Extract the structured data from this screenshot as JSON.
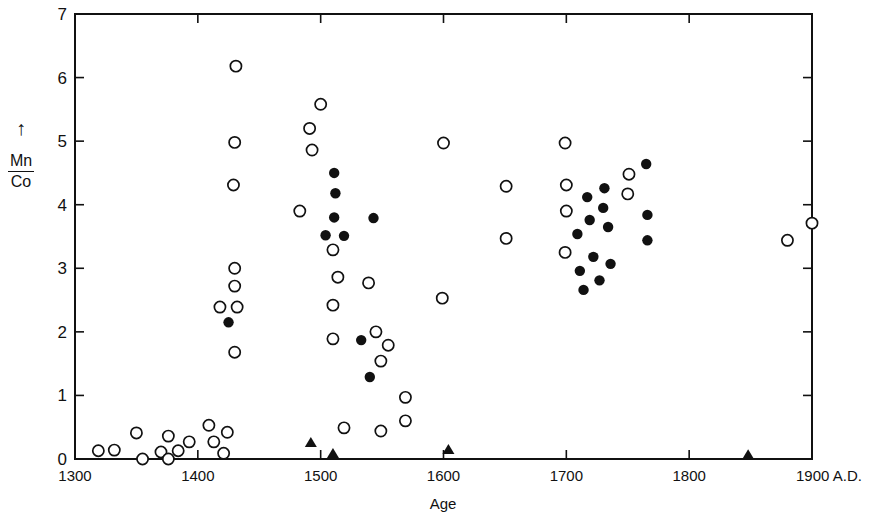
{
  "chart_data": {
    "type": "scatter",
    "title": "",
    "xlabel": "Age",
    "ylabel_numerator": "Mn",
    "ylabel_denominator": "Co",
    "ylabel_arrow": "↑",
    "x_unit_suffix": "A.D.",
    "xlim": [
      1300,
      1900
    ],
    "ylim": [
      0,
      7
    ],
    "x_ticks": [
      1300,
      1400,
      1500,
      1600,
      1700,
      1800,
      1900
    ],
    "x_tick_labels": [
      "1300",
      "1400",
      "1500",
      "1600",
      "1700",
      "1800",
      "1900 A.D."
    ],
    "y_ticks": [
      0,
      1,
      2,
      3,
      4,
      5,
      6,
      7
    ],
    "y_tick_labels": [
      "0",
      "1",
      "2",
      "3",
      "4",
      "5",
      "6",
      "7"
    ],
    "grid": false,
    "legend": null,
    "series": [
      {
        "name": "open circles",
        "marker": "open-circle",
        "points": [
          [
            1319,
            0.13
          ],
          [
            1332,
            0.14
          ],
          [
            1350,
            0.41
          ],
          [
            1355,
            0.0
          ],
          [
            1370,
            0.11
          ],
          [
            1376,
            0.36
          ],
          [
            1384,
            0.13
          ],
          [
            1376,
            0.0
          ],
          [
            1393,
            0.27
          ],
          [
            1409,
            0.53
          ],
          [
            1424,
            0.42
          ],
          [
            1413,
            0.27
          ],
          [
            1421,
            0.09
          ],
          [
            1431,
            6.18
          ],
          [
            1430,
            4.98
          ],
          [
            1429,
            4.31
          ],
          [
            1430,
            3.0
          ],
          [
            1430,
            2.72
          ],
          [
            1418,
            2.39
          ],
          [
            1432,
            2.39
          ],
          [
            1430,
            1.68
          ],
          [
            1500,
            5.58
          ],
          [
            1491,
            5.2
          ],
          [
            1493,
            4.86
          ],
          [
            1483,
            3.9
          ],
          [
            1510,
            3.29
          ],
          [
            1514,
            2.86
          ],
          [
            1539,
            2.77
          ],
          [
            1510,
            2.42
          ],
          [
            1510,
            1.89
          ],
          [
            1545,
            2.0
          ],
          [
            1555,
            1.79
          ],
          [
            1549,
            1.54
          ],
          [
            1569,
            0.97
          ],
          [
            1569,
            0.6
          ],
          [
            1519,
            0.49
          ],
          [
            1549,
            0.44
          ],
          [
            1600,
            4.97
          ],
          [
            1651,
            4.29
          ],
          [
            1651,
            3.47
          ],
          [
            1599,
            2.53
          ],
          [
            1699,
            4.97
          ],
          [
            1700,
            4.31
          ],
          [
            1700,
            3.9
          ],
          [
            1699,
            3.25
          ],
          [
            1751,
            4.48
          ],
          [
            1750,
            4.17
          ],
          [
            1880,
            3.44
          ],
          [
            1900,
            3.71
          ]
        ]
      },
      {
        "name": "filled circles",
        "marker": "filled-circle",
        "points": [
          [
            1425,
            2.15
          ],
          [
            1511,
            4.5
          ],
          [
            1512,
            4.18
          ],
          [
            1511,
            3.8
          ],
          [
            1504,
            3.52
          ],
          [
            1519,
            3.51
          ],
          [
            1543,
            3.79
          ],
          [
            1533,
            1.87
          ],
          [
            1540,
            1.29
          ],
          [
            1765,
            4.64
          ],
          [
            1731,
            4.26
          ],
          [
            1717,
            4.12
          ],
          [
            1730,
            3.95
          ],
          [
            1766,
            3.84
          ],
          [
            1719,
            3.76
          ],
          [
            1734,
            3.65
          ],
          [
            1709,
            3.54
          ],
          [
            1766,
            3.44
          ],
          [
            1722,
            3.18
          ],
          [
            1736,
            3.07
          ],
          [
            1711,
            2.96
          ],
          [
            1727,
            2.81
          ],
          [
            1714,
            2.66
          ]
        ]
      },
      {
        "name": "triangles",
        "marker": "filled-triangle",
        "points": [
          [
            1492,
            0.25
          ],
          [
            1510,
            0.08
          ],
          [
            1604,
            0.14
          ],
          [
            1848,
            0.06
          ]
        ]
      }
    ]
  },
  "colors": {
    "ink": "#111111",
    "background": "#ffffff"
  }
}
